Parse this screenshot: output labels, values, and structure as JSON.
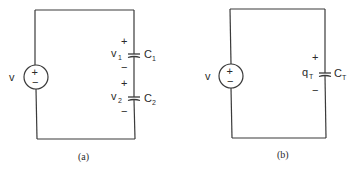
{
  "figure": {
    "panels": [
      {
        "id": "a",
        "caption": "(a)",
        "source": {
          "label": "v",
          "plus": "+",
          "minus": "−"
        },
        "capacitors": [
          {
            "voltage_label": "v",
            "voltage_sub": "1",
            "name": "C",
            "name_sub": "1",
            "plus": "+",
            "minus": "−"
          },
          {
            "voltage_label": "v",
            "voltage_sub": "2",
            "name": "C",
            "name_sub": "2",
            "plus": "+",
            "minus": "−"
          }
        ]
      },
      {
        "id": "b",
        "caption": "(b)",
        "source": {
          "label": "v",
          "plus": "+",
          "minus": "−"
        },
        "capacitors": [
          {
            "voltage_label": "q",
            "voltage_sub": "T",
            "name": "C",
            "name_sub": "T",
            "plus": "+",
            "minus": "−"
          }
        ]
      }
    ]
  }
}
